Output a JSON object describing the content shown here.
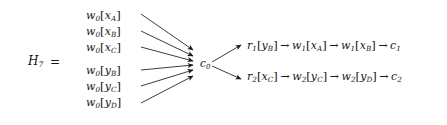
{
  "figure": {
    "label": "H",
    "label_subscript": "7",
    "equals": "="
  },
  "inputs": {
    "group_x": [
      {
        "op": "w",
        "op_sub": "0",
        "open": "[",
        "var": "x",
        "var_sub": "A",
        "close": "]"
      },
      {
        "op": "w",
        "op_sub": "0",
        "open": "[",
        "var": "x",
        "var_sub": "B",
        "close": "]"
      },
      {
        "op": "w",
        "op_sub": "0",
        "open": "[",
        "var": "x",
        "var_sub": "C",
        "close": "]"
      }
    ],
    "group_y": [
      {
        "op": "w",
        "op_sub": "0",
        "open": "[",
        "var": "y",
        "var_sub": "B",
        "close": "]"
      },
      {
        "op": "w",
        "op_sub": "0",
        "open": "[",
        "var": "y",
        "var_sub": "C",
        "close": "]"
      },
      {
        "op": "w",
        "op_sub": "0",
        "open": "[",
        "var": "y",
        "var_sub": "D",
        "close": "]"
      }
    ]
  },
  "center_node": {
    "op": "c",
    "op_sub": "0"
  },
  "chains": {
    "top": {
      "arrow": "→",
      "steps": [
        {
          "op": "r",
          "op_sub": "1",
          "open": "[",
          "var": "y",
          "var_sub": "B",
          "close": "]"
        },
        {
          "op": "w",
          "op_sub": "1",
          "open": "[",
          "var": "x",
          "var_sub": "A",
          "close": "]"
        },
        {
          "op": "w",
          "op_sub": "1",
          "open": "[",
          "var": "x",
          "var_sub": "B",
          "close": "]"
        },
        {
          "op": "c",
          "op_sub": "1",
          "open": "",
          "var": "",
          "var_sub": "",
          "close": ""
        }
      ]
    },
    "bottom": {
      "arrow": "→",
      "steps": [
        {
          "op": "r",
          "op_sub": "2",
          "open": "[",
          "var": "x",
          "var_sub": "C",
          "close": "]"
        },
        {
          "op": "w",
          "op_sub": "2",
          "open": "[",
          "var": "y",
          "var_sub": "C",
          "close": "]"
        },
        {
          "op": "w",
          "op_sub": "2",
          "open": "[",
          "var": "y",
          "var_sub": "D",
          "close": "]"
        },
        {
          "op": "c",
          "op_sub": "2",
          "open": "",
          "var": "",
          "var_sub": "",
          "close": ""
        }
      ]
    }
  },
  "style": {
    "ink": "#161616",
    "edge_color": "#1a1a1a",
    "background": "#ffffff"
  },
  "layout": {
    "input_rows_y": [
      16,
      32,
      48,
      71,
      87,
      103
    ],
    "hub": {
      "x": 196,
      "y": 63
    },
    "edge_start_x": 140,
    "fan_in_targets_y": [
      50,
      56,
      61,
      65,
      70,
      76
    ],
    "fan_out_targets": [
      [
        243,
        45
      ],
      [
        243,
        79
      ]
    ]
  }
}
